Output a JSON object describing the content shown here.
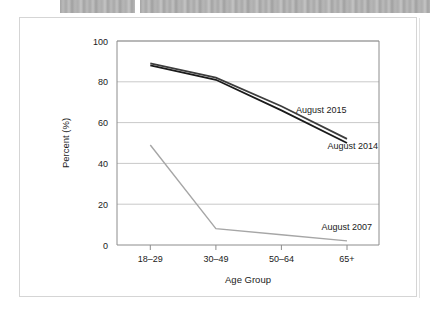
{
  "top_bars": {
    "left_bar_name": "redacted-heading-bar",
    "right_bar_name": "redacted-text-bar"
  },
  "chart_data": {
    "type": "line",
    "title": "",
    "subtitle": "",
    "xlabel": "Age Group",
    "ylabel": "Percent (%)",
    "categories": [
      "18–29",
      "30–49",
      "50–64",
      "65+"
    ],
    "x_tick_labels": [
      "18–29",
      "30–49",
      "50–64",
      "65+"
    ],
    "y_tick_labels": [
      "0",
      "20",
      "40",
      "60",
      "80",
      "100"
    ],
    "y_ticks": [
      0,
      20,
      40,
      60,
      80,
      100
    ],
    "ylim": [
      0,
      100
    ],
    "grid": "horizontal",
    "legend_position": "inline-annotations",
    "series": [
      {
        "name": "August 2015",
        "label": "August 2015",
        "color": "#3d3d3d",
        "values": [
          89,
          82,
          68,
          52
        ]
      },
      {
        "name": "August 2014",
        "label": "August 2014",
        "color": "#1a1a1a",
        "values": [
          88,
          81,
          66,
          50
        ]
      },
      {
        "name": "August 2007",
        "label": "August 2007",
        "color": "#a6a6a6",
        "values": [
          49,
          8,
          5,
          2
        ]
      }
    ],
    "annotations": [
      {
        "text": "August 2015",
        "series": "August 2015"
      },
      {
        "text": "August 2014",
        "series": "August 2014"
      },
      {
        "text": "August 2007",
        "series": "August 2007"
      }
    ]
  },
  "colors": {
    "grid": "#c9c9c9",
    "axis": "#8c8c8c",
    "frame": "#d5d5d5",
    "text": "#1a1a1a"
  }
}
